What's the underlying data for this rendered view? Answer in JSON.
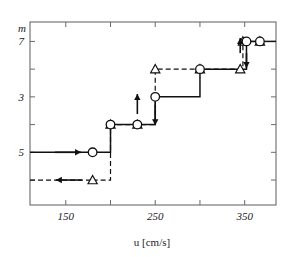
{
  "chart_data": {
    "type": "line",
    "title": "",
    "xlabel": "u   [cm/s]",
    "ylabel": "m",
    "xlim": [
      110,
      385
    ],
    "ylim": [
      0.3,
      6.9
    ],
    "y_inverted": true,
    "grid": false,
    "legend_position": "none",
    "x_ticks": [
      150,
      200,
      250,
      300,
      350
    ],
    "x_tick_labels": [
      "150",
      "",
      "250",
      "",
      "350"
    ],
    "y_ticks": [
      1,
      2,
      3,
      4,
      5,
      6
    ],
    "y_tick_labels": [
      "7",
      "",
      "3",
      "",
      "5",
      ""
    ],
    "y_tick_labels_shown": [
      "5",
      "3",
      "7"
    ],
    "series": [
      {
        "name": "increasing-u-branch",
        "marker": "circle",
        "line": "solid",
        "points": [
          {
            "x": 180,
            "y": 5
          },
          {
            "x": 200,
            "y": 4
          },
          {
            "x": 230,
            "y": 4
          },
          {
            "x": 250,
            "y": 3
          },
          {
            "x": 300,
            "y": 2
          },
          {
            "x": 352,
            "y": 1
          },
          {
            "x": 367,
            "y": 1
          }
        ]
      },
      {
        "name": "decreasing-u-branch",
        "marker": "triangle",
        "line": "dashed",
        "points": [
          {
            "x": 180,
            "y": 6
          },
          {
            "x": 200,
            "y": 4
          },
          {
            "x": 230,
            "y": 4
          },
          {
            "x": 250,
            "y": 2
          },
          {
            "x": 300,
            "y": 2
          },
          {
            "x": 345,
            "y": 2
          },
          {
            "x": 348,
            "y": 1
          },
          {
            "x": 367,
            "y": 1
          }
        ]
      }
    ],
    "annotations": [
      {
        "name": "arrow-left-top",
        "type": "arrow",
        "direction": "left",
        "x": 150,
        "y": 6
      },
      {
        "name": "arrow-right-top",
        "type": "arrow",
        "direction": "right",
        "x": 150,
        "y": 5
      },
      {
        "name": "arrow-down-mid",
        "type": "arrow",
        "direction": "down",
        "x": 250,
        "y": 3.5
      },
      {
        "name": "arrow-up-mid",
        "type": "arrow",
        "direction": "up",
        "x": 230,
        "y": 3.3
      },
      {
        "name": "arrow-up-right",
        "type": "arrow",
        "direction": "up",
        "x": 345,
        "y": 1.5
      },
      {
        "name": "arrow-down-right",
        "type": "arrow",
        "direction": "down",
        "x": 352,
        "y": 1.5
      }
    ]
  },
  "axes": {
    "y_axis_name": "m",
    "x_axis_title": "u   [cm/s]"
  }
}
